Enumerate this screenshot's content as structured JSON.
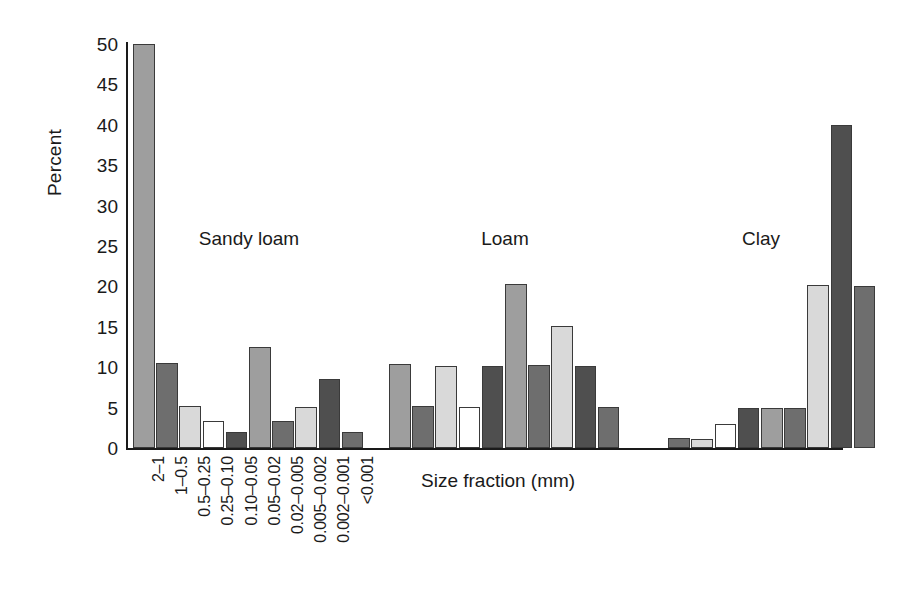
{
  "chart_data": {
    "type": "bar",
    "title": "",
    "xlabel": "Size fraction (mm)",
    "ylabel": "Percent",
    "ylim": [
      0,
      50
    ],
    "yticks": [
      0,
      5,
      10,
      15,
      20,
      25,
      30,
      35,
      40,
      45,
      50
    ],
    "grid": false,
    "legend": "none",
    "categories": [
      "2–1",
      "1–0.5",
      "0.5–0.25",
      "0.25–0.10",
      "0.10–0.05",
      "0.05–0.02",
      "0.02–0.005",
      "0.005–0.002",
      "0.002–0.001",
      "<0.001"
    ],
    "group_labels": [
      "Sandy loam",
      "Loam",
      "Clay"
    ],
    "series": [
      {
        "name": "Sandy loam",
        "values": [
          50.0,
          10.5,
          5.2,
          3.3,
          2.0,
          12.5,
          3.4,
          5.1,
          8.5,
          2.0
        ]
      },
      {
        "name": "Loam",
        "values": [
          10.4,
          5.2,
          10.1,
          5.1,
          10.2,
          20.3,
          10.3,
          15.1,
          10.2,
          5.1
        ]
      },
      {
        "name": "Clay",
        "values": [
          0.0,
          1.2,
          1.1,
          3.0,
          5.0,
          5.0,
          5.0,
          20.2,
          40.0,
          20.1
        ]
      }
    ],
    "bar_shades": [
      "#9e9e9e",
      "#6e6e6e",
      "#d9d9d9",
      "#ffffff",
      "#4f4f4f",
      "#9e9e9e",
      "#6e6e6e",
      "#d9d9d9",
      "#4f4f4f",
      "#6e6e6e"
    ],
    "bar_edge_color": "#3a3a3a",
    "axis_color": "#1a1a1a",
    "background": "#ffffff"
  }
}
